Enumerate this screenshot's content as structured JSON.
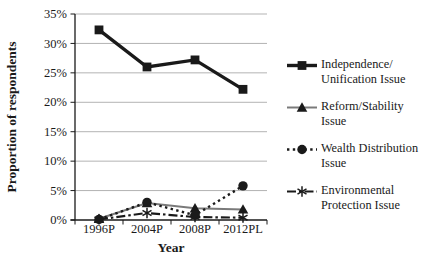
{
  "chart_data": {
    "type": "line",
    "title": "",
    "xlabel": "Year",
    "ylabel": "Proportion of respondents",
    "categories": [
      "1996P",
      "2004P",
      "2008P",
      "2012PL"
    ],
    "y_ticks": [
      "0%",
      "5%",
      "10%",
      "15%",
      "20%",
      "25%",
      "30%",
      "35%"
    ],
    "ylim": [
      0,
      35
    ],
    "grid": true,
    "legend_position": "right",
    "series": [
      {
        "name": "Independence/Unification Issue",
        "marker": "square",
        "line": "solid-thick",
        "color": "#1a1a1a",
        "values": [
          32.3,
          26.0,
          27.2,
          22.2
        ]
      },
      {
        "name": "Reform/Stability Issue",
        "marker": "triangle",
        "line": "solid",
        "color": "#7a7a7a",
        "values": [
          0.2,
          2.9,
          2.0,
          1.8
        ]
      },
      {
        "name": "Wealth Distribution Issue",
        "marker": "circle",
        "line": "dotted",
        "color": "#1a1a1a",
        "values": [
          0.1,
          3.0,
          0.8,
          5.8
        ]
      },
      {
        "name": "Environmental Protection Issue",
        "marker": "asterisk",
        "line": "dash-dot",
        "color": "#1a1a1a",
        "values": [
          0.1,
          1.2,
          0.5,
          0.4
        ]
      }
    ]
  },
  "legend": {
    "items": [
      {
        "line1": "Independence/",
        "line2": "Unification Issue"
      },
      {
        "line1": "Reform/Stability",
        "line2": "Issue"
      },
      {
        "line1": "Wealth Distribution",
        "line2": "Issue"
      },
      {
        "line1": "Environmental",
        "line2": "Protection Issue"
      }
    ]
  },
  "colors": {
    "axis": "#1a1a1a",
    "gridline": "#b3b3b3",
    "text": "#1a1a1a",
    "background": "#ffffff"
  }
}
